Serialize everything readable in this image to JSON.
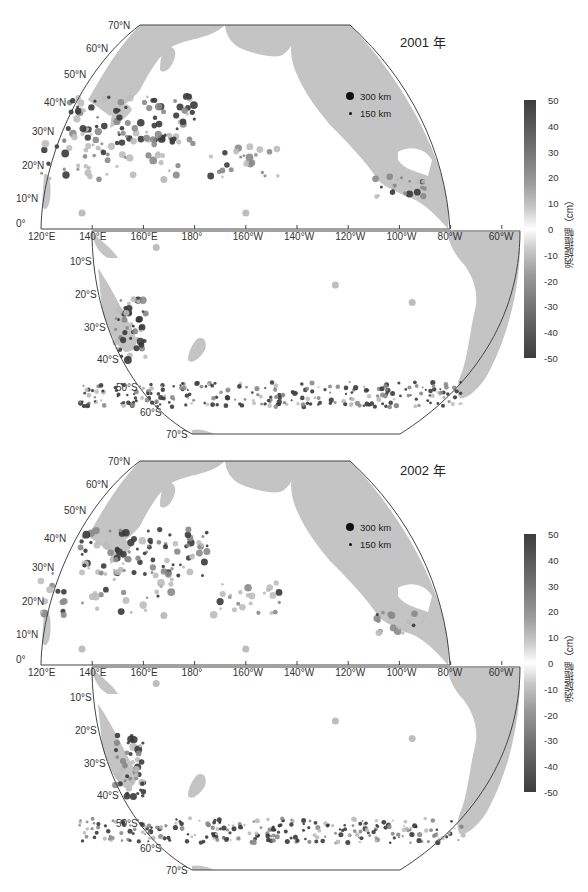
{
  "figure": {
    "colorbar": {
      "label": "涡旋振幅（cm）",
      "ticks": [
        "50",
        "40",
        "30",
        "20",
        "10",
        "0",
        "-10",
        "-20",
        "-30",
        "-40",
        "-50"
      ],
      "range_cm": [
        -50,
        50
      ],
      "colormap": "grayscale diverging (dark at ±50, white at 0)"
    },
    "size_legend": [
      {
        "label": "300 km"
      },
      {
        "label": "150 km"
      }
    ],
    "lat_labels_north": [
      "70°N",
      "60°N",
      "50°N",
      "40°N",
      "30°N",
      "20°N",
      "10°N",
      "0°"
    ],
    "lat_labels_south": [
      "10°S",
      "20°S",
      "30°S",
      "40°S",
      "50°S",
      "60°S",
      "70°S"
    ],
    "lon_labels": [
      "120°E",
      "140°E",
      "160°E",
      "180°",
      "160°W",
      "140°W",
      "120°W",
      "100°W",
      "80°W",
      "60°W"
    ],
    "colors": {
      "land": "#c4c4c4",
      "frame": "#444444",
      "eddy_dark": "#3a3a3a",
      "eddy_mid": "#8a8a8a",
      "eddy_light": "#bdbdbd"
    },
    "panels": [
      {
        "title": "2001 年",
        "eddy_clusters": [
          {
            "region": "Kuroshio Extension",
            "lat": 33,
            "lon": 155,
            "intensity": "high"
          },
          {
            "region": "Subtropical NW Pacific",
            "lat": 22,
            "lon": 140,
            "intensity": "medium"
          },
          {
            "region": "Hawaii lee",
            "lat": 20,
            "lon": -160,
            "intensity": "medium"
          },
          {
            "region": "East Australian Current",
            "lat": -33,
            "lon": 155,
            "intensity": "high"
          },
          {
            "region": "Southern Ocean / ACC",
            "lat": -55,
            "lon": -150,
            "intensity": "high"
          },
          {
            "region": "Central Mexico coast",
            "lat": 13,
            "lon": -100,
            "intensity": "medium"
          }
        ]
      },
      {
        "title": "2002 年",
        "eddy_clusters": [
          {
            "region": "Kuroshio Extension",
            "lat": 35,
            "lon": 160,
            "intensity": "high"
          },
          {
            "region": "Subtropical NW Pacific",
            "lat": 22,
            "lon": 138,
            "intensity": "medium"
          },
          {
            "region": "Hawaii lee",
            "lat": 20,
            "lon": -160,
            "intensity": "medium"
          },
          {
            "region": "East Australian Current",
            "lat": -33,
            "lon": 155,
            "intensity": "high"
          },
          {
            "region": "Southern Ocean / ACC",
            "lat": -55,
            "lon": -150,
            "intensity": "high"
          },
          {
            "region": "Central Mexico coast",
            "lat": 13,
            "lon": -100,
            "intensity": "medium"
          }
        ]
      }
    ]
  }
}
